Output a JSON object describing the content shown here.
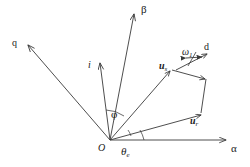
{
  "figure": {
    "kind": "vector-diagram",
    "background_color": "#ffffff",
    "line_color": "#3a3a3a",
    "text_color": "#1a1a1a",
    "width": 250,
    "height": 167
  },
  "axes": {
    "alpha": {
      "label": "α",
      "x": 232,
      "y": 148
    },
    "beta": {
      "label": "β",
      "x": 142,
      "y": 6
    },
    "origin": {
      "label": "O",
      "x": 99,
      "y": 146
    }
  },
  "vectors": {
    "q_axis": {
      "label": "q",
      "x": 13,
      "y": 40
    },
    "current": {
      "label": "i",
      "x": 89,
      "y": 62
    },
    "u_s": {
      "label": "u",
      "subscript": "s",
      "x": 160,
      "y": 58
    },
    "u_r": {
      "label": "u",
      "subscript": "r",
      "x": 191,
      "y": 113
    },
    "omega": {
      "label": "ω",
      "subscript": "1",
      "x": 183,
      "y": 45
    },
    "d_axis": {
      "label": "d",
      "x": 205,
      "y": 45
    }
  },
  "angles": {
    "phi": {
      "label": "φ",
      "x": 112,
      "y": 112
    },
    "theta_e": {
      "label": "θ",
      "subscript": "e",
      "x": 122,
      "y": 145
    }
  },
  "geometry": {
    "origin_point": [
      110,
      140
    ],
    "alpha_end": [
      228,
      140
    ],
    "beta_end": [
      134,
      12
    ],
    "q_end": [
      26,
      44
    ],
    "i_end": [
      99,
      62
    ],
    "u_s_point": [
      170,
      70
    ],
    "d_corner": [
      205,
      78
    ],
    "u_r_point": [
      200,
      114
    ],
    "omega_arrow": {
      "x1": 183,
      "x2": 200,
      "y": 58
    },
    "d_arrow": {
      "x1": 180,
      "y1": 68,
      "x2": 206,
      "y2": 54
    }
  }
}
